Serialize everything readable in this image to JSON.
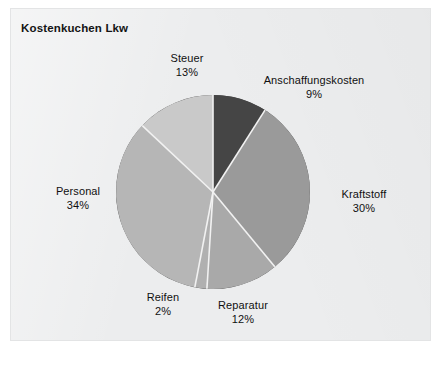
{
  "figure": {
    "title": "Kostenkuchen Lkw",
    "background_color": "#ecedee"
  },
  "chart_data": {
    "type": "pie",
    "title": "Kostenkuchen Lkw",
    "xlabel": "",
    "ylabel": "",
    "units": "percent",
    "total": 100,
    "legend": "none (labels placed around slices)",
    "grid": false,
    "start_angle_deg": 0,
    "direction": "clockwise",
    "categories": [
      "Anschaffungskosten",
      "Kraftstoff",
      "Reparatur",
      "Reifen",
      "Personal",
      "Steuer"
    ],
    "values": [
      9,
      30,
      12,
      2,
      34,
      13
    ],
    "slices": [
      {
        "label": "Anschaffungskosten",
        "value": 9,
        "value_text": "9",
        "pct_text": "9%",
        "color": "#454545"
      },
      {
        "label": "Kraftstoff",
        "value": 30,
        "value_text": "30",
        "pct_text": "30%",
        "color": "#9a9a9a"
      },
      {
        "label": "Reparatur",
        "value": 12,
        "value_text": "12",
        "pct_text": "12%",
        "color": "#a9a9a9"
      },
      {
        "label": "Reifen",
        "value": 2,
        "value_text": "2",
        "pct_text": "2%",
        "color": "#b0b0b0"
      },
      {
        "label": "Personal",
        "value": 34,
        "value_text": "34",
        "pct_text": "34%",
        "color": "#b6b6b6"
      },
      {
        "label": "Steuer",
        "value": 13,
        "value_text": "13",
        "pct_text": "13%",
        "color": "#c9c9c9"
      }
    ],
    "separator_color": "#f2f2f2",
    "center": [
      213,
      192
    ],
    "radius": 97
  }
}
